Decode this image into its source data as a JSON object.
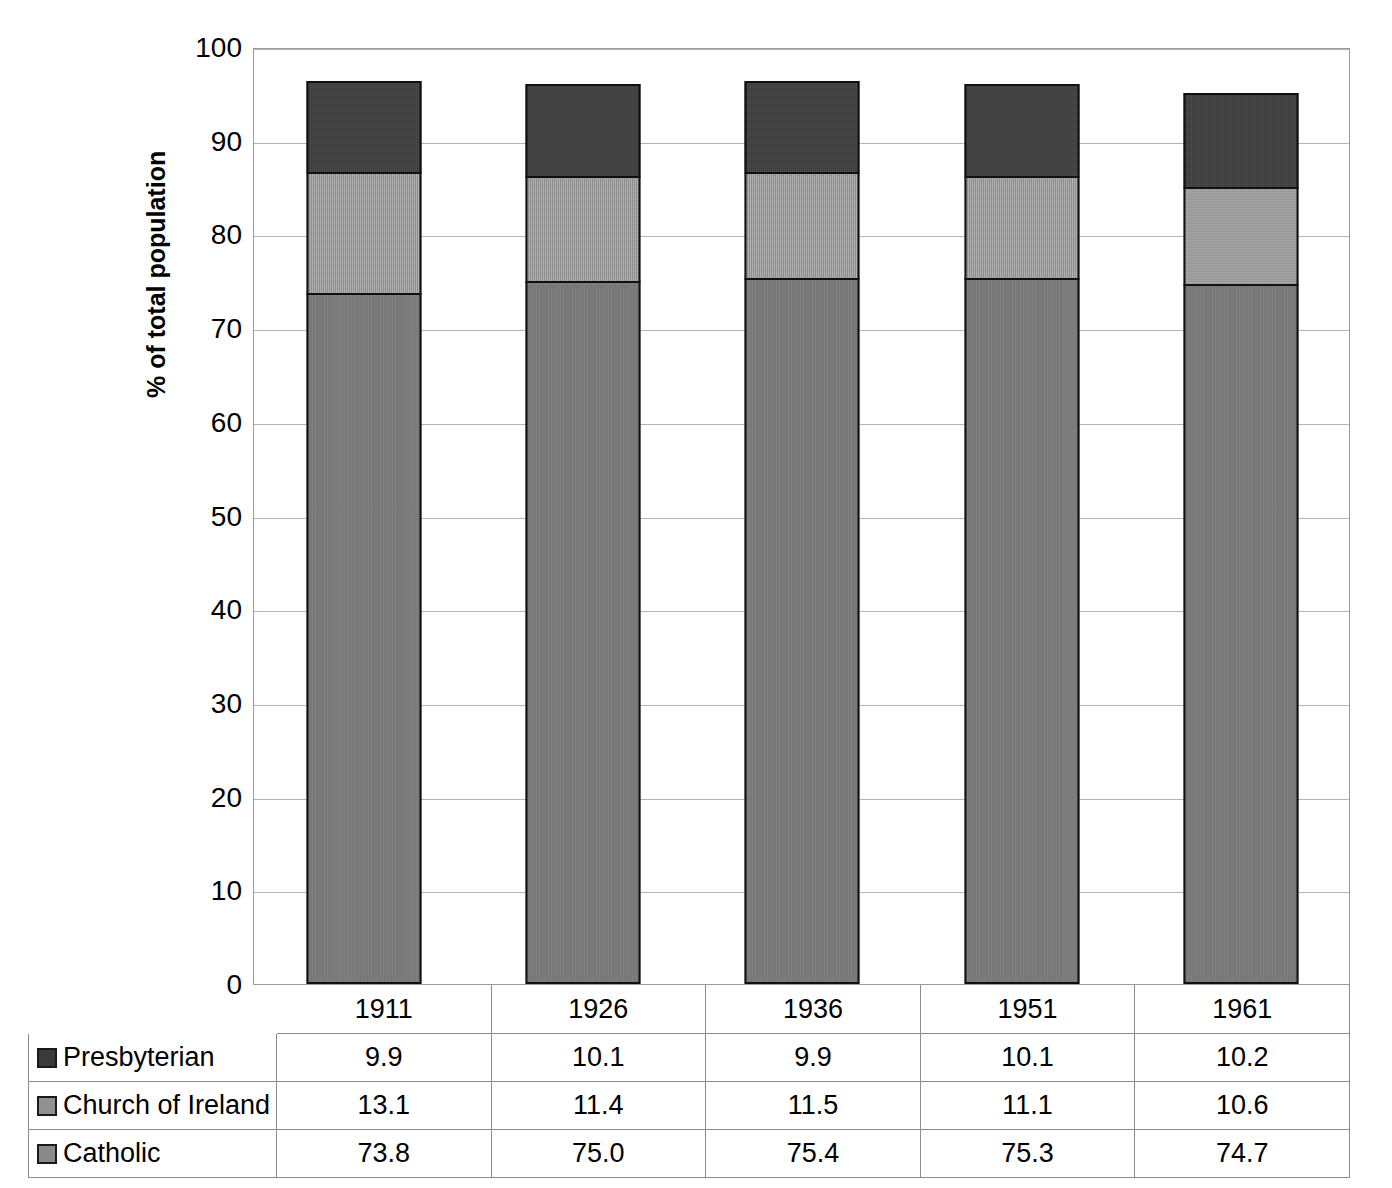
{
  "chart_data": {
    "type": "bar",
    "subtype": "stacked-column",
    "title": "",
    "xlabel": "",
    "ylabel": "% of total population",
    "ylim": [
      0,
      100
    ],
    "ytick_step": 10,
    "yticks": [
      0,
      10,
      20,
      30,
      40,
      50,
      60,
      70,
      80,
      90,
      100
    ],
    "ytick_labels": [
      "0",
      "10",
      "20",
      "30",
      "40",
      "50",
      "60",
      "70",
      "80",
      "90",
      "100"
    ],
    "grid": true,
    "grid_axis": "y",
    "legend_position": "data-table-row-labels",
    "categories": [
      "1911",
      "1926",
      "1936",
      "1951",
      "1961"
    ],
    "stack_order_bottom_to_top": [
      "Catholic",
      "Church of Ireland",
      "Presbyterian"
    ],
    "series": [
      {
        "name": "Presbyterian",
        "color": "#3a3a3a",
        "values": [
          9.9,
          10.1,
          9.9,
          10.1,
          10.2
        ]
      },
      {
        "name": "Church of Ireland",
        "color": "#919191",
        "values": [
          13.1,
          11.4,
          11.5,
          11.1,
          10.6
        ]
      },
      {
        "name": "Catholic",
        "color": "#787878",
        "values": [
          73.8,
          75.0,
          75.4,
          75.3,
          74.7
        ]
      }
    ],
    "stack_totals": [
      96.8,
      96.5,
      96.8,
      96.5,
      95.5
    ]
  },
  "table": {
    "header_row": [
      "",
      "1911",
      "1926",
      "1936",
      "1951",
      "1961"
    ],
    "rows": [
      {
        "label": "Presbyterian",
        "key_class": "k-presbyterian",
        "values": [
          "9.9",
          "10.1",
          "9.9",
          "10.1",
          "10.2"
        ]
      },
      {
        "label": "Church of Ireland",
        "key_class": "k-churchofireland",
        "values": [
          "13.1",
          "11.4",
          "11.5",
          "11.1",
          "10.6"
        ]
      },
      {
        "label": "Catholic",
        "key_class": "k-catholic",
        "values": [
          "73.8",
          "75.0",
          "75.4",
          "75.3",
          "74.7"
        ]
      }
    ]
  }
}
